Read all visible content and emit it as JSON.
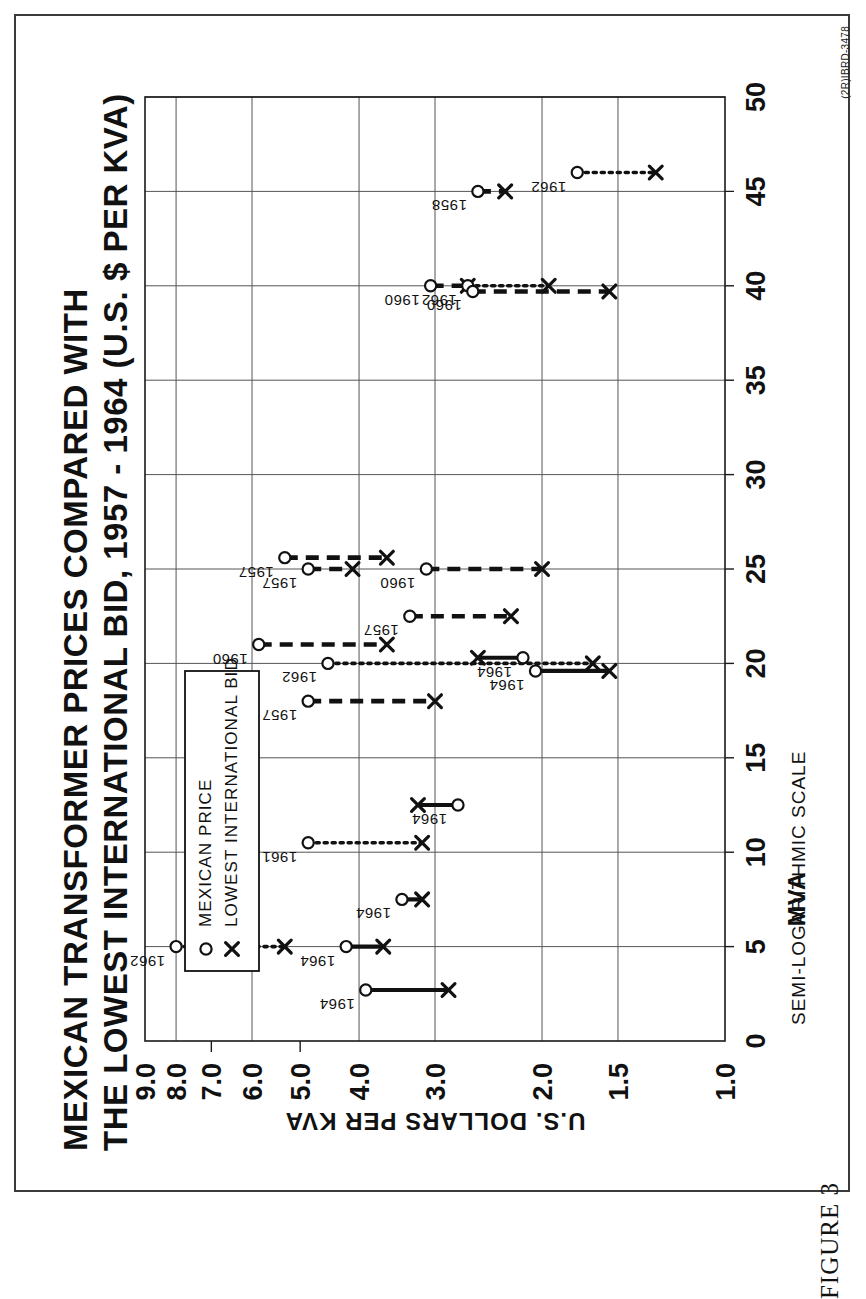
{
  "figure": {
    "caption": "FIGURE 3",
    "doc_id": "(2R)IBRD-3478"
  },
  "chart_data": {
    "type": "scatter",
    "title_line1": "MEXICAN TRANSFORMER PRICES COMPARED WITH",
    "title_line2": "THE LOWEST INTERNATIONAL BID, 1957 - 1964 (U.S. $ PER KVA)",
    "xlabel": "MVA",
    "ylabel": "U.S. DOLLARS PER KVA",
    "scale_note": "SEMI-LOGARITHMIC SCALE",
    "xlim": [
      0,
      50
    ],
    "ylim": [
      1.0,
      9.0
    ],
    "yscale": "log",
    "grid": true,
    "xticks": [
      0,
      5,
      10,
      15,
      20,
      25,
      30,
      35,
      40,
      45,
      50
    ],
    "xticklabels": [
      "0",
      "5",
      "10",
      "15",
      "20",
      "25",
      "30",
      "35",
      "40",
      "45",
      "50"
    ],
    "yticks": [
      9.0,
      8.0,
      7.0,
      6.0,
      5.0,
      4.0,
      3.0,
      2.0,
      1.5,
      1.0
    ],
    "yticklabels": [
      "9.0",
      "8.0",
      "7.0",
      "6.0",
      "5.0",
      "4.0",
      "3.0",
      "2.0",
      "1.5",
      "1.0"
    ],
    "ygridlines": [
      9.0,
      8.0,
      6.0,
      4.0,
      3.0,
      2.0,
      1.5,
      1.0
    ],
    "legend": {
      "position": "top-left",
      "entries": [
        {
          "marker": "o",
          "label": "MEXICAN PRICE"
        },
        {
          "marker": "x",
          "label": "LOWEST INTERNATIONAL BID"
        }
      ]
    },
    "series": [
      {
        "name": "MEXICAN PRICE",
        "marker": "circle"
      },
      {
        "name": "LOWEST INTERNATIONAL BID",
        "marker": "cross"
      }
    ],
    "points": [
      {
        "year": "1962",
        "mva": 5.0,
        "mexican_price": 8.0,
        "lowest_bid": 5.3,
        "linestyle": "dotted"
      },
      {
        "year": "1964",
        "mva": 2.7,
        "mexican_price": 3.9,
        "lowest_bid": 2.85,
        "linestyle": "solid"
      },
      {
        "year": "1964",
        "mva": 5.0,
        "mexican_price": 4.2,
        "lowest_bid": 3.65,
        "linestyle": "solid"
      },
      {
        "year": "1964",
        "mva": 7.5,
        "mexican_price": 3.4,
        "lowest_bid": 3.15,
        "linestyle": "solid"
      },
      {
        "year": "1961",
        "mva": 10.5,
        "mexican_price": 4.85,
        "lowest_bid": 3.15,
        "linestyle": "dotted"
      },
      {
        "year": "1964",
        "mva": 12.5,
        "mexican_price": 2.75,
        "lowest_bid": 3.2,
        "linestyle": "solid"
      },
      {
        "year": "1957",
        "mva": 18.0,
        "mexican_price": 4.85,
        "lowest_bid": 3.0,
        "linestyle": "dashed"
      },
      {
        "year": "1960",
        "mva": 21.0,
        "mexican_price": 5.85,
        "lowest_bid": 3.6,
        "linestyle": "dashed"
      },
      {
        "year": "1962",
        "mva": 20.0,
        "mexican_price": 4.5,
        "lowest_bid": 1.65,
        "linestyle": "dotted"
      },
      {
        "year": "1964",
        "mva": 20.3,
        "mexican_price": 2.15,
        "lowest_bid": 2.55,
        "linestyle": "solid"
      },
      {
        "year": "1964",
        "mva": 19.6,
        "mexican_price": 2.05,
        "lowest_bid": 1.55,
        "linestyle": "solid"
      },
      {
        "year": "1957",
        "mva": 22.5,
        "mexican_price": 3.3,
        "lowest_bid": 2.25,
        "linestyle": "dashed"
      },
      {
        "year": "1957",
        "mva": 25.6,
        "mexican_price": 5.3,
        "lowest_bid": 3.6,
        "linestyle": "dashed"
      },
      {
        "year": "1957",
        "mva": 25.0,
        "mexican_price": 4.85,
        "lowest_bid": 4.1,
        "linestyle": "dashed"
      },
      {
        "year": "1960",
        "mva": 25.0,
        "mexican_price": 3.1,
        "lowest_bid": 2.0,
        "linestyle": "dashed"
      },
      {
        "year": "1960",
        "mva": 40.0,
        "mexican_price": 3.05,
        "lowest_bid": 2.65,
        "linestyle": "dashed"
      },
      {
        "year": "1962",
        "mva": 40.0,
        "mexican_price": 2.65,
        "lowest_bid": 1.95,
        "linestyle": "dotted"
      },
      {
        "year": "1960",
        "mva": 39.7,
        "mexican_price": 2.6,
        "lowest_bid": 1.55,
        "linestyle": "dashed"
      },
      {
        "year": "1958",
        "mva": 45.0,
        "mexican_price": 2.55,
        "lowest_bid": 2.3,
        "linestyle": "dashed"
      },
      {
        "year": "1962",
        "mva": 46.0,
        "mexican_price": 1.75,
        "lowest_bid": 1.3,
        "linestyle": "dotted"
      }
    ]
  }
}
